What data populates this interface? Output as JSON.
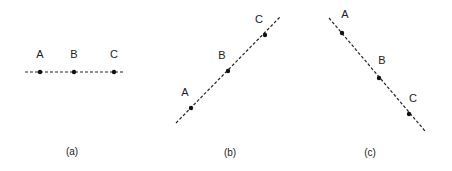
{
  "figure": {
    "panels": [
      {
        "id": "a",
        "caption": "(a)",
        "caption_pos": [
          72,
          155
        ],
        "line": [
          25,
          72,
          125,
          72
        ],
        "points": [
          {
            "label": "A",
            "x": 40,
            "y": 72,
            "lx": 40,
            "ly": 58
          },
          {
            "label": "B",
            "x": 74,
            "y": 72,
            "lx": 74,
            "ly": 58
          },
          {
            "label": "C",
            "x": 114,
            "y": 72,
            "lx": 114,
            "ly": 58
          }
        ]
      },
      {
        "id": "b",
        "caption": "(b)",
        "caption_pos": [
          230,
          156
        ],
        "line": [
          176,
          123,
          281,
          16
        ],
        "points": [
          {
            "label": "A",
            "x": 191,
            "y": 108,
            "lx": 185,
            "ly": 96
          },
          {
            "label": "B",
            "x": 228,
            "y": 71,
            "lx": 222,
            "ly": 59
          },
          {
            "label": "C",
            "x": 265,
            "y": 35,
            "lx": 259,
            "ly": 23
          }
        ]
      },
      {
        "id": "c",
        "caption": "(c)",
        "caption_pos": [
          370,
          156
        ],
        "line": [
          329,
          18,
          425,
          131
        ],
        "points": [
          {
            "label": "A",
            "x": 342,
            "y": 33,
            "lx": 345,
            "ly": 18
          },
          {
            "label": "B",
            "x": 379,
            "y": 78,
            "lx": 382,
            "ly": 64
          },
          {
            "label": "C",
            "x": 409,
            "y": 114,
            "lx": 413,
            "ly": 102
          }
        ]
      }
    ],
    "colors": {
      "ink": "#222222",
      "background": "#ffffff"
    }
  }
}
